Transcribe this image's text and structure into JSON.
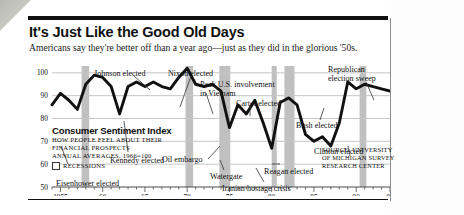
{
  "headline": "It's Just Like the Good Old Days",
  "dek": "Americans say they're better off than a year ago—just as they did in the glorious '50s.",
  "legend": {
    "title": "Consumer Sentiment Index",
    "line1": "How people feel about their",
    "line2": "financial prospects",
    "line3": "Annual averages, 1966=100",
    "key_label": "Recessions"
  },
  "source": {
    "line1": "Source: University",
    "line2": "of Michigan Survey",
    "line3": "Research Center"
  },
  "chart_data": {
    "type": "line",
    "title": "Consumer Sentiment Index",
    "xlabel": "",
    "ylabel": "Index (1966=100)",
    "xlim": [
      1954,
      1994
    ],
    "ylim": [
      50,
      103
    ],
    "yticks": [
      100,
      90,
      80,
      70,
      60,
      50
    ],
    "xticks": [
      1955,
      1960,
      1965,
      1970,
      1975,
      1980,
      1985,
      1990,
      1994
    ],
    "xtick_labels": [
      "1955",
      "60",
      "65",
      "70",
      "75",
      "80",
      "85",
      "90",
      "94"
    ],
    "grid": true,
    "legend_position": "inside-lower-left",
    "x": [
      1954,
      1955,
      1956,
      1957,
      1958,
      1959,
      1960,
      1961,
      1962,
      1963,
      1964,
      1965,
      1966,
      1967,
      1968,
      1969,
      1970,
      1971,
      1972,
      1973,
      1974,
      1975,
      1976,
      1977,
      1978,
      1979,
      1980,
      1981,
      1982,
      1983,
      1984,
      1985,
      1986,
      1987,
      1988,
      1989,
      1990,
      1991,
      1992,
      1993,
      1994
    ],
    "values": [
      86,
      91,
      88,
      84,
      95,
      99,
      98,
      94,
      82,
      94,
      96,
      94,
      96,
      94,
      93,
      98,
      102,
      95,
      94,
      95,
      92,
      76,
      86,
      82,
      88,
      78,
      67,
      87,
      89,
      86,
      73,
      70,
      72,
      68,
      78,
      96,
      93,
      95,
      94,
      93,
      92
    ],
    "series": [
      {
        "name": "Consumer Sentiment Index",
        "values": [
          86,
          91,
          88,
          84,
          95,
          99,
          98,
          94,
          82,
          94,
          96,
          94,
          96,
          94,
          93,
          98,
          102,
          95,
          94,
          95,
          92,
          76,
          86,
          82,
          88,
          78,
          67,
          87,
          89,
          86,
          73,
          70,
          72,
          68,
          78,
          96,
          93,
          95,
          94,
          93,
          92
        ]
      }
    ],
    "recessions": [
      {
        "start": 1957.5,
        "end": 1958.4
      },
      {
        "start": 1969.8,
        "end": 1970.7
      },
      {
        "start": 1973.8,
        "end": 1975.1
      },
      {
        "start": 1980.0,
        "end": 1980.6
      },
      {
        "start": 1981.5,
        "end": 1982.7
      },
      {
        "start": 1990.4,
        "end": 1991.2
      }
    ],
    "annotations": [
      {
        "text": "Eisenhower elected",
        "x": 1953,
        "y": 80
      },
      {
        "text": "Johnson elected",
        "x": 1963,
        "y": 102
      },
      {
        "text": "Kennedy elected",
        "x": 1961,
        "y": 83
      },
      {
        "text": "Nixon elected",
        "x": 1968.5,
        "y": 102
      },
      {
        "text": "Peak U.S. involvement in Vietnam",
        "x": 1970.5,
        "y": 100
      },
      {
        "text": "Oil embargo",
        "x": 1973.5,
        "y": 72
      },
      {
        "text": "Watergate",
        "x": 1974.5,
        "y": 62
      },
      {
        "text": "Carter elected",
        "x": 1977,
        "y": 92
      },
      {
        "text": "Iranian hostage crisis",
        "x": 1979.5,
        "y": 57
      },
      {
        "text": "Reagan elected",
        "x": 1981,
        "y": 65
      },
      {
        "text": "Bush elected",
        "x": 1988,
        "y": 80
      },
      {
        "text": "Clinton elected",
        "x": 1992,
        "y": 72
      },
      {
        "text": "Republican election sweep",
        "x": 1993,
        "y": 101
      }
    ]
  }
}
